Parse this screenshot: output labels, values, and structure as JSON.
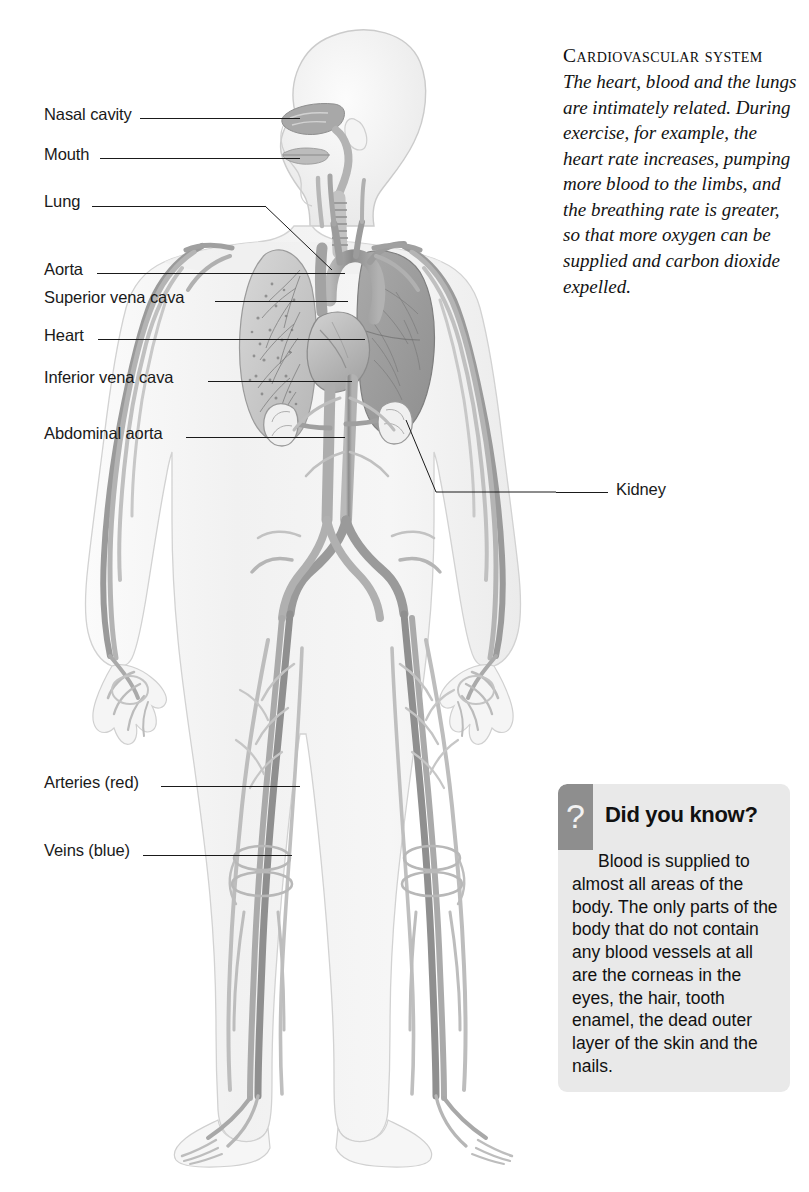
{
  "article": {
    "title": "Cardiovascular system",
    "body": "The heart, blood and the lungs are intimately related. During exercise, for example, the heart rate increases, pumping more blood to the limbs, and the breathing rate is greater, so that more oxygen can be supplied and carbon dioxide expelled."
  },
  "did_you_know": {
    "icon": "question-mark-icon",
    "icon_glyph": "?",
    "heading": "Did you know?",
    "body": "Blood is supplied to almost all areas of the body. The only parts of the body that do not contain any blood vessels at all are the corneas in the eyes, the hair, tooth enamel, the dead outer layer of the skin and the nails."
  },
  "labels": {
    "left": [
      {
        "text": "Nasal cavity",
        "y": 115,
        "line_x1": 140,
        "line_x2": 300,
        "line_y": 118
      },
      {
        "text": "Mouth",
        "y": 155,
        "line_x1": 100,
        "line_x2": 300,
        "line_y": 158
      },
      {
        "text": "Lung",
        "y": 202,
        "line_x1": 92,
        "line_x2": 265,
        "line_y": 206
      },
      {
        "text": "Aorta",
        "y": 270,
        "line_x1": 97,
        "line_x2": 345,
        "line_y": 273
      },
      {
        "text": "Superior vena cava",
        "y": 298,
        "line_x1": 215,
        "line_x2": 348,
        "line_y": 301
      },
      {
        "text": "Heart",
        "y": 336,
        "line_x1": 98,
        "line_x2": 365,
        "line_y": 339
      },
      {
        "text": "Inferior vena cava",
        "y": 378,
        "line_x1": 208,
        "line_x2": 352,
        "line_y": 381
      },
      {
        "text": "Abdominal aorta",
        "y": 434,
        "line_x1": 186,
        "line_x2": 345,
        "line_y": 437
      },
      {
        "text": "Arteries (red)",
        "y": 783,
        "line_x1": 161,
        "line_x2": 300,
        "line_y": 786
      },
      {
        "text": "Veins (blue)",
        "y": 851,
        "line_x1": 143,
        "line_x2": 292,
        "line_y": 855
      }
    ],
    "right": [
      {
        "text": "Kidney",
        "y": 490,
        "line_x1": 556,
        "line_x2": 608,
        "line_y": 492
      }
    ]
  },
  "figure": {
    "name": "human-cardiovascular-system-illustration",
    "view": "anterior whole body with head in profile",
    "colors": {
      "skin": "#f4f4f4",
      "skin_edge": "#cfcfcf",
      "vessel_dark": "#8a8a8a",
      "vessel_mid": "#a8a8a8",
      "vessel_light": "#c4c4c4",
      "organ_dark": "#9a9a9a",
      "organ_mid": "#b4b4b4",
      "organ_light": "#dcdcdc",
      "leader_line": "#1a1a1a"
    },
    "organs": [
      "nasal cavity",
      "mouth",
      "trachea",
      "lungs",
      "heart",
      "aorta",
      "superior vena cava",
      "inferior vena cava",
      "abdominal aorta",
      "kidneys"
    ]
  }
}
